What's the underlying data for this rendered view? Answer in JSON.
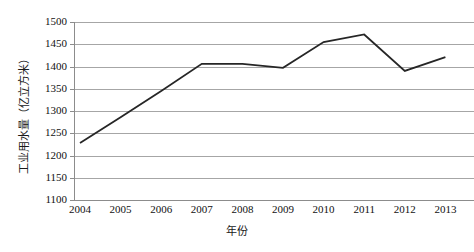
{
  "chart_data": {
    "type": "line",
    "title": "",
    "xlabel": "年份",
    "ylabel": "工业用水量（亿立方米）",
    "categories": [
      "2004",
      "2005",
      "2006",
      "2007",
      "2008",
      "2009",
      "2010",
      "2011",
      "2012",
      "2013"
    ],
    "values": [
      1228,
      1286,
      1345,
      1406,
      1406,
      1397,
      1455,
      1472,
      1390,
      1421
    ],
    "series": [
      {
        "name": "工业用水量",
        "values": [
          1228,
          1286,
          1345,
          1406,
          1406,
          1397,
          1455,
          1472,
          1390,
          1421
        ]
      }
    ],
    "ylim": [
      1100,
      1500
    ],
    "ytick_step": 50,
    "yticks": [
      "1500",
      "1450",
      "1400",
      "1350",
      "1300",
      "1250",
      "1200",
      "1150",
      "1100"
    ],
    "ytick_values": [
      1500,
      1450,
      1400,
      1350,
      1300,
      1250,
      1200,
      1150,
      1100
    ],
    "grid": "horizontal",
    "legend": "none",
    "line_color": "#262626",
    "grid_color": "#a6a6a6",
    "axis_color": "#8c8c8c",
    "background_color": "#ffffff",
    "markers": "none",
    "annotations": []
  }
}
